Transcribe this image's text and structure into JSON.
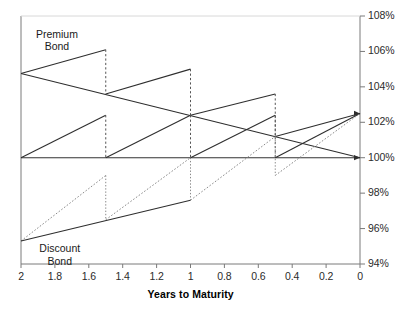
{
  "chart_data": {
    "type": "line",
    "title": "",
    "xlabel": "Years to Maturity",
    "ylabel": "",
    "xlim": [
      2,
      0
    ],
    "ylim": [
      94,
      108
    ],
    "x_reversed": true,
    "grid": false,
    "legend_position": "inline-annotations",
    "x_ticks": [
      "2",
      "1.8",
      "1.6",
      "1.4",
      "1.2",
      "1",
      "0.8",
      "0.6",
      "0.4",
      "0.2",
      "0"
    ],
    "x_tick_values": [
      2,
      1.8,
      1.6,
      1.4,
      1.2,
      1,
      0.8,
      0.6,
      0.4,
      0.2,
      0
    ],
    "y_ticks": [
      "94%",
      "96%",
      "98%",
      "100%",
      "102%",
      "104%",
      "106%",
      "108%"
    ],
    "y_tick_values": [
      94,
      96,
      98,
      100,
      102,
      104,
      106,
      108
    ],
    "annotations": [
      {
        "text": "Premium\nBond",
        "x": 1.9,
        "y": 107.0,
        "name": "premium-bond-label"
      },
      {
        "text": "Discount\nBond",
        "x": 1.88,
        "y": 94.9,
        "name": "discount-bond-label"
      }
    ],
    "reference_lines": [
      {
        "name": "par-value-line",
        "y": 100,
        "style": "solid",
        "color": "#333333",
        "label": "Par 100%"
      }
    ],
    "series": [
      {
        "name": "Premium bond dirty price",
        "style": "solid",
        "color": "#2e2e2e",
        "points": [
          [
            2,
            104.75
          ],
          [
            1.5,
            106.1
          ],
          [
            1.5,
            103.6
          ],
          [
            1.0,
            105.0
          ],
          [
            1.0,
            102.4
          ],
          [
            0.5,
            103.6
          ],
          [
            0.5,
            101.2
          ],
          [
            0.0,
            102.5
          ]
        ],
        "coupon_drops": [
          {
            "x": 1.5,
            "from": 106.1,
            "to": 103.6
          },
          {
            "x": 1.0,
            "from": 105.0,
            "to": 102.4
          },
          {
            "x": 0.5,
            "from": 103.6,
            "to": 101.2
          }
        ]
      },
      {
        "name": "Premium bond clean price",
        "style": "solid",
        "color": "#2e2e2e",
        "points": [
          [
            2,
            104.75
          ],
          [
            0.0,
            100.0
          ]
        ]
      },
      {
        "name": "Accrued interest (from par)",
        "style": "solid",
        "color": "#2e2e2e",
        "points": [
          [
            2,
            100.0
          ],
          [
            1.5,
            102.4
          ],
          [
            1.5,
            100.0
          ],
          [
            1.0,
            102.4
          ],
          [
            1.0,
            100.0
          ],
          [
            0.5,
            102.4
          ],
          [
            0.5,
            100.0
          ],
          [
            0.0,
            102.5
          ]
        ],
        "coupon_drops": [
          {
            "x": 1.5,
            "from": 102.4,
            "to": 100.0
          },
          {
            "x": 1.0,
            "from": 102.4,
            "to": 100.0
          },
          {
            "x": 0.5,
            "from": 102.4,
            "to": 100.0
          }
        ]
      },
      {
        "name": "Discount bond dirty price",
        "style": "dotted",
        "color": "#8a8a8a",
        "points": [
          [
            2,
            95.3
          ],
          [
            1.5,
            99.0
          ],
          [
            1.5,
            96.5
          ],
          [
            1.0,
            100.0
          ],
          [
            1.0,
            97.6
          ],
          [
            0.5,
            101.2
          ],
          [
            0.5,
            99.0
          ],
          [
            0.0,
            102.5
          ]
        ],
        "coupon_drops": [
          {
            "x": 1.5,
            "from": 99.0,
            "to": 96.5
          },
          {
            "x": 1.0,
            "from": 100.0,
            "to": 97.6
          },
          {
            "x": 0.5,
            "from": 101.2,
            "to": 99.0
          }
        ]
      },
      {
        "name": "Discount bond clean price",
        "style": "solid",
        "color": "#2e2e2e",
        "points": [
          [
            2,
            95.3
          ],
          [
            1.0,
            97.6
          ],
          [
            0.0,
            100.0
          ]
        ]
      }
    ],
    "colors": {
      "axis": "#7a7a7a",
      "solid_line": "#2e2e2e",
      "dotted_line": "#8a8a8a",
      "dashed_drop": "#555555",
      "text": "#2b2b2b",
      "background": "#ffffff"
    }
  }
}
